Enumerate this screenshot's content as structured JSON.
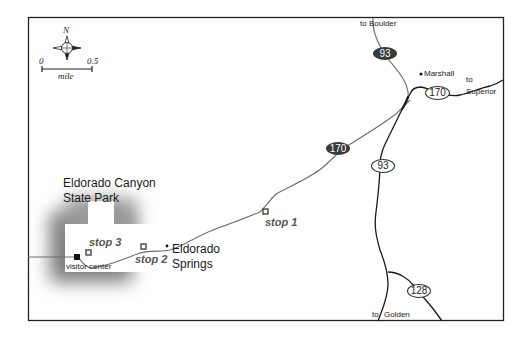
{
  "map": {
    "park": {
      "name_line1": "Eldorado Canyon",
      "name_line2": "State Park"
    },
    "compass": {
      "north_label": "N"
    },
    "scale_bar": {
      "start": "0",
      "end": "0.5",
      "unit": "mile"
    },
    "places": {
      "eldorado_line1": "Eldorado",
      "eldorado_line2": "Springs",
      "marshall": "Marshall",
      "visitor_center": "visitor center"
    },
    "stops": {
      "stop1": "stop 1",
      "stop2": "stop 2",
      "stop3": "stop 3"
    },
    "directions": {
      "boulder": "to Boulder",
      "superior_line1": "to",
      "superior_line2": "Superior",
      "golden_to": "to",
      "golden": "Golden"
    },
    "routes": {
      "hwy93_north": "93",
      "hwy170_main": "170",
      "hwy170_east": "170",
      "hwy93_south": "93",
      "hwy128": "128"
    },
    "colors": {
      "frame": "#222222",
      "road_gray": "#6e6e6e",
      "road_black": "#1a1a1a",
      "park_shadow": "#8a8a8a",
      "dark_shield": "#3a3a3a"
    }
  }
}
